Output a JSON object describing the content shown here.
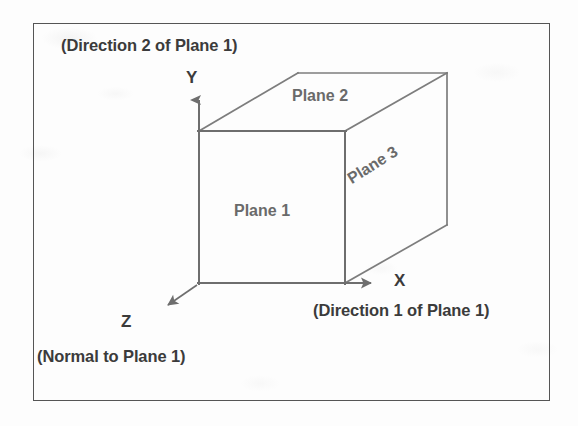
{
  "figure": {
    "type": "3d-coordinate-axes-cube-diagram",
    "frame_border_color": "#555555",
    "background_color": "#fdfdfd",
    "line_color": "#777777",
    "text_color": "#3b3b3b",
    "plane_label_color": "#6a6a6a"
  },
  "annotations": {
    "direction2": "(Direction 2 of Plane 1)",
    "direction1": "(Direction 1 of Plane 1)",
    "normal": "(Normal to  Plane 1)"
  },
  "axes": {
    "y": {
      "label": "Y",
      "meaning": "(Direction 2 of Plane 1)",
      "direction": "up"
    },
    "x": {
      "label": "X",
      "meaning": "(Direction 1 of Plane 1)",
      "direction": "right"
    },
    "z": {
      "label": "Z",
      "meaning": "(Normal to  Plane 1)",
      "direction": "down-left"
    }
  },
  "planes": [
    {
      "id": "plane-1",
      "label": "Plane 1",
      "face": "front",
      "normal_axis": "Z",
      "direction_1_axis": "X",
      "direction_2_axis": "Y"
    },
    {
      "id": "plane-2",
      "label": "Plane 2",
      "face": "top",
      "normal_axis": "Y"
    },
    {
      "id": "plane-3",
      "label": "Plane 3",
      "face": "right",
      "normal_axis": "X"
    }
  ],
  "geometry": {
    "origin": [
      199,
      283
    ],
    "front_face": {
      "x0": 199,
      "y0": 131,
      "x1": 345,
      "y1": 283
    },
    "depth_offset": [
      99,
      -58
    ],
    "y_axis_tip": [
      198,
      88
    ],
    "x_axis_tip": [
      382,
      283
    ],
    "z_axis_tip": [
      160,
      311
    ]
  }
}
